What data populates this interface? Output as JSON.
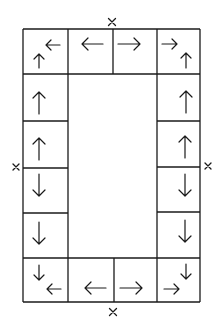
{
  "diagram": {
    "type": "grid-frame-with-arrows",
    "grid": {
      "columns_x": [
        23,
        68,
        157,
        200
      ],
      "top_bottom_middle_divider_x": 113,
      "rows_y": [
        29,
        74,
        121,
        168,
        213,
        258,
        302
      ]
    },
    "marks": [
      {
        "name": "top-mark",
        "symbol": "×",
        "x": 112,
        "y": 22
      },
      {
        "name": "bottom-mark",
        "symbol": "×",
        "x": 113,
        "y": 312
      },
      {
        "name": "left-mark",
        "symbol": "×",
        "x": 16,
        "y": 167
      },
      {
        "name": "right-mark",
        "symbol": "×",
        "x": 208,
        "y": 166
      }
    ],
    "cells": [
      {
        "name": "top-left-corner",
        "arrows": [
          "left",
          "up"
        ]
      },
      {
        "name": "top-middle-left",
        "arrows": [
          "left"
        ]
      },
      {
        "name": "top-middle-right",
        "arrows": [
          "right"
        ]
      },
      {
        "name": "top-right-corner",
        "arrows": [
          "right",
          "up"
        ]
      },
      {
        "name": "left-row-1",
        "arrows": [
          "up"
        ]
      },
      {
        "name": "left-row-2",
        "arrows": [
          "up"
        ]
      },
      {
        "name": "left-row-3",
        "arrows": [
          "down"
        ]
      },
      {
        "name": "left-row-4",
        "arrows": [
          "down"
        ]
      },
      {
        "name": "right-row-1",
        "arrows": [
          "up"
        ]
      },
      {
        "name": "right-row-2",
        "arrows": [
          "up"
        ]
      },
      {
        "name": "right-row-3",
        "arrows": [
          "down"
        ]
      },
      {
        "name": "right-row-4",
        "arrows": [
          "down"
        ]
      },
      {
        "name": "bottom-left-corner",
        "arrows": [
          "down",
          "left"
        ]
      },
      {
        "name": "bottom-middle-left",
        "arrows": [
          "left"
        ]
      },
      {
        "name": "bottom-middle-right",
        "arrows": [
          "right"
        ]
      },
      {
        "name": "bottom-right-corner",
        "arrows": [
          "right",
          "down"
        ]
      }
    ]
  }
}
